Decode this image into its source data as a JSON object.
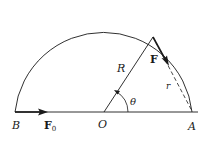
{
  "figure": {
    "labels": {
      "B": "B",
      "O": "O",
      "A": "A",
      "R": "R",
      "r": "r",
      "theta": "θ",
      "F": "F",
      "F0_main": "F",
      "F0_sub": "0"
    },
    "colors": {
      "stroke": "#1a1a1a",
      "background": "#ffffff"
    },
    "geometry_data": {
      "theta_deg": 60
    }
  }
}
